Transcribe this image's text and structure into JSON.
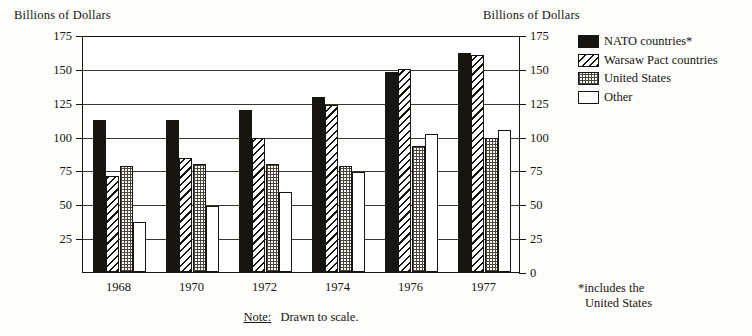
{
  "axis_title_left": "Billions of Dollars",
  "axis_title_right": "Billions of Dollars",
  "note": {
    "keyword": "Note:",
    "text": "Drawn to scale."
  },
  "footnote": {
    "line1": "*includes the",
    "line2": "United States"
  },
  "legend": {
    "items": [
      {
        "label": "NATO countries*",
        "pattern": "solid-black",
        "color": "#171510"
      },
      {
        "label": "Warsaw Pact countries",
        "pattern": "diagonal-hatch",
        "color": "#171510"
      },
      {
        "label": "United States",
        "pattern": "fine-dots",
        "color": "#4a463c"
      },
      {
        "label": "Other",
        "pattern": "white-outline",
        "color": "#ffffff"
      }
    ]
  },
  "chart_data": {
    "type": "bar",
    "title": "",
    "xlabel": "",
    "ylabel": "Billions of Dollars",
    "ylim": [
      0,
      175
    ],
    "yticks": [
      0,
      25,
      50,
      75,
      100,
      125,
      150,
      175
    ],
    "ytick_labels": [
      "0",
      "25",
      "50",
      "75",
      "100",
      "125",
      "150",
      "175"
    ],
    "grid": true,
    "dual_axis": true,
    "legend_position": "right",
    "categories": [
      "1968",
      "1970",
      "1972",
      "1974",
      "1976",
      "1977"
    ],
    "series": [
      {
        "name": "NATO countries*",
        "values": [
          112,
          112,
          120,
          129,
          148,
          162
        ]
      },
      {
        "name": "Warsaw Pact countries",
        "values": [
          71,
          84,
          99,
          123,
          150,
          160
        ]
      },
      {
        "name": "United States",
        "values": [
          78,
          80,
          80,
          78,
          93,
          99
        ]
      },
      {
        "name": "Other",
        "values": [
          37,
          49,
          59,
          74,
          102,
          105
        ]
      }
    ]
  }
}
